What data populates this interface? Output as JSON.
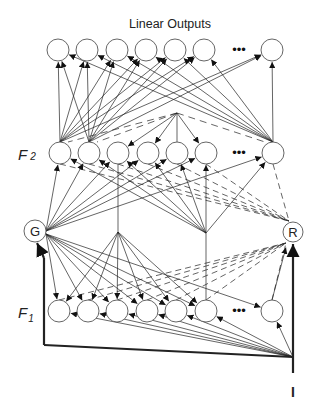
{
  "title": "Linear Outputs",
  "layers": {
    "output": {
      "label": "",
      "y": 50,
      "x": [
        58,
        87,
        117,
        146,
        175,
        204,
        272
      ]
    },
    "f2": {
      "label": "F",
      "sub": "2",
      "y": 153,
      "x": [
        60,
        89,
        118,
        148,
        177,
        206,
        273
      ]
    },
    "f1": {
      "label": "F",
      "sub": "1",
      "y": 311,
      "x": [
        59,
        88,
        117,
        147,
        176,
        206,
        272
      ]
    }
  },
  "ellipsis": "•••",
  "nodes": {
    "gain": {
      "label": "G",
      "x": 35,
      "y": 231
    },
    "reset": {
      "label": "R",
      "x": 293,
      "y": 232
    }
  },
  "input": {
    "label": "I",
    "x": 293,
    "y": 357
  },
  "colors": {
    "line": "#222222",
    "node_stroke": "#555555",
    "background": "#ffffff"
  }
}
